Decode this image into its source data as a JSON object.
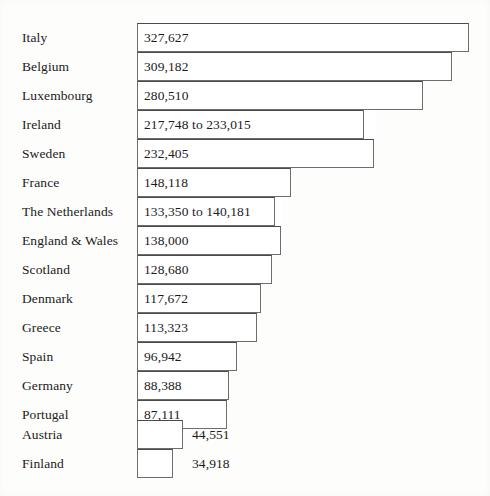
{
  "chart_data": {
    "type": "bar",
    "orientation": "horizontal",
    "title": "",
    "subtitle": "",
    "xlabel": "",
    "ylabel": "",
    "grid": false,
    "legend": null,
    "axis_visible": false,
    "xlim": [
      0,
      327627
    ],
    "categories": [
      "Italy",
      "Belgium",
      "Luxembourg",
      "Ireland",
      "Sweden",
      "France",
      "The Netherlands",
      "England & Wales",
      "Scotland",
      "Denmark",
      "Greece",
      "Spain",
      "Germany",
      "Portugal",
      "Austria",
      "Finland"
    ],
    "values": [
      327627,
      309182,
      233015,
      233015,
      232405,
      148118,
      140181,
      138000,
      128680,
      117672,
      113323,
      96942,
      88388,
      87111,
      44551,
      34918
    ],
    "value_labels": [
      "327,627",
      "309,182",
      "280,510",
      "217,748 to 233,015",
      "232,405",
      "148,118",
      "133,350 to 140,181",
      "138,000",
      "128,680",
      "117,672",
      "113,323",
      "96,942",
      "88,388",
      "87,111",
      "44,551",
      "34,918"
    ],
    "bars": [
      {
        "category": "Italy",
        "value": 327627,
        "value_label": "327,627",
        "range": null,
        "label_inside": true,
        "bar_left_px": 137,
        "bar_width_px": 332,
        "range_seg_px": 0,
        "top_px": 23
      },
      {
        "category": "Belgium",
        "value": 309182,
        "value_label": "309,182",
        "range": null,
        "label_inside": true,
        "bar_left_px": 137,
        "bar_width_px": 315,
        "range_seg_px": 0,
        "top_px": 52
      },
      {
        "category": "Luxembourg",
        "value": 280510,
        "value_label": "280,510",
        "range": null,
        "label_inside": true,
        "bar_left_px": 137,
        "bar_width_px": 286,
        "range_seg_px": 0,
        "top_px": 81
      },
      {
        "category": "Ireland",
        "value": 233015,
        "value_label": "217,748 to 233,015",
        "range": [
          217748,
          233015
        ],
        "label_inside": true,
        "bar_left_px": 137,
        "bar_width_px": 238,
        "range_seg_px": 12,
        "top_px": 110
      },
      {
        "category": "Sweden",
        "value": 232405,
        "value_label": "232,405",
        "range": null,
        "label_inside": true,
        "bar_left_px": 137,
        "bar_width_px": 237,
        "range_seg_px": 0,
        "top_px": 139
      },
      {
        "category": "France",
        "value": 148118,
        "value_label": "148,118",
        "range": null,
        "label_inside": true,
        "bar_left_px": 137,
        "bar_width_px": 154,
        "range_seg_px": 0,
        "top_px": 168
      },
      {
        "category": "The Netherlands",
        "value": 140181,
        "value_label": "133,350 to 140,181",
        "range": [
          133350,
          140181
        ],
        "label_inside": true,
        "bar_left_px": 137,
        "bar_width_px": 146,
        "range_seg_px": 9,
        "top_px": 197
      },
      {
        "category": "England & Wales",
        "value": 138000,
        "value_label": "138,000",
        "range": null,
        "label_inside": true,
        "bar_left_px": 137,
        "bar_width_px": 144,
        "range_seg_px": 0,
        "top_px": 226
      },
      {
        "category": "Scotland",
        "value": 128680,
        "value_label": "128,680",
        "range": null,
        "label_inside": true,
        "bar_left_px": 137,
        "bar_width_px": 135,
        "range_seg_px": 0,
        "top_px": 255
      },
      {
        "category": "Denmark",
        "value": 117672,
        "value_label": "117,672",
        "range": null,
        "label_inside": true,
        "bar_left_px": 137,
        "bar_width_px": 124,
        "range_seg_px": 0,
        "top_px": 284
      },
      {
        "category": "Greece",
        "value": 113323,
        "value_label": "113,323",
        "range": null,
        "label_inside": true,
        "bar_left_px": 137,
        "bar_width_px": 120,
        "range_seg_px": 0,
        "top_px": 313
      },
      {
        "category": "Spain",
        "value": 96942,
        "value_label": "96,942",
        "range": null,
        "label_inside": true,
        "bar_left_px": 137,
        "bar_width_px": 100,
        "range_seg_px": 0,
        "top_px": 342
      },
      {
        "category": "Germany",
        "value": 88388,
        "value_label": "88,388",
        "range": null,
        "label_inside": true,
        "bar_left_px": 137,
        "bar_width_px": 92,
        "range_seg_px": 0,
        "top_px": 371
      },
      {
        "category": "Portugal",
        "value": 87111,
        "value_label": "87,111",
        "range": null,
        "label_inside": true,
        "bar_left_px": 137,
        "bar_width_px": 90,
        "range_seg_px": 0,
        "top_px": 400
      },
      {
        "category": "Austria",
        "value": 44551,
        "value_label": "44,551",
        "range": null,
        "label_inside": false,
        "bar_left_px": 137,
        "bar_width_px": 46,
        "range_seg_px": 0,
        "top_px": 420,
        "outside_label_left_px": 192
      },
      {
        "category": "Finland",
        "value": 34918,
        "value_label": "34,918",
        "range": null,
        "label_inside": false,
        "bar_left_px": 137,
        "bar_width_px": 36,
        "range_seg_px": 0,
        "top_px": 449,
        "outside_label_left_px": 192
      }
    ],
    "colors": {
      "bar_fill": "#ffffff",
      "bar_stroke": "#6d6d6d",
      "text": "#1b1b1b",
      "background": "#fdfdfc"
    }
  }
}
